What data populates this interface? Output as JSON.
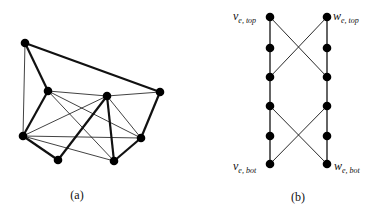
{
  "figure_a": {
    "caption": "(a)",
    "nodes": [
      {
        "id": "A",
        "x": 25,
        "y": 43
      },
      {
        "id": "B",
        "x": 48,
        "y": 91
      },
      {
        "id": "C",
        "x": 107,
        "y": 96
      },
      {
        "id": "D",
        "x": 160,
        "y": 92
      },
      {
        "id": "E",
        "x": 23,
        "y": 136
      },
      {
        "id": "F",
        "x": 58,
        "y": 160
      },
      {
        "id": "G",
        "x": 114,
        "y": 161
      },
      {
        "id": "H",
        "x": 141,
        "y": 138
      }
    ],
    "thick_edges": [
      [
        "A",
        "B"
      ],
      [
        "A",
        "D"
      ],
      [
        "B",
        "E"
      ],
      [
        "E",
        "F"
      ],
      [
        "F",
        "C"
      ],
      [
        "C",
        "G"
      ],
      [
        "G",
        "H"
      ],
      [
        "H",
        "D"
      ]
    ],
    "thin_edges": [
      [
        "A",
        "E"
      ],
      [
        "B",
        "C"
      ],
      [
        "C",
        "D"
      ],
      [
        "B",
        "H"
      ],
      [
        "B",
        "G"
      ],
      [
        "E",
        "C"
      ],
      [
        "E",
        "H"
      ],
      [
        "E",
        "G"
      ],
      [
        "C",
        "H"
      ]
    ]
  },
  "figure_b": {
    "caption": "(b)",
    "left_x": 270,
    "right_x": 327,
    "rows_y": [
      17,
      48,
      77,
      106,
      136,
      164
    ],
    "labels": {
      "v_top": {
        "main": "v",
        "sub": "e, top"
      },
      "w_top": {
        "main": "w",
        "sub": "e, top"
      },
      "v_bot": {
        "main": "v",
        "sub": "e, bot"
      },
      "w_bot": {
        "main": "w",
        "sub": "e, bot"
      }
    }
  }
}
